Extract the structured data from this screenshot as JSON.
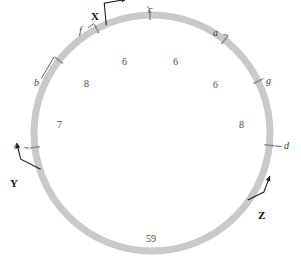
{
  "diagram": {
    "circle": {
      "center_x": 152,
      "center_y": 133,
      "radius": 118,
      "band_width": 7,
      "band_color": "#c9c9c9"
    },
    "genes": [
      {
        "id": "a",
        "label": "a",
        "angle_deg": 52,
        "label_x": 213,
        "label_y": 28,
        "leader": true
      },
      {
        "id": "b",
        "label": "b",
        "angle_deg": 142,
        "label_x": 34,
        "label_y": 78,
        "leader": true
      },
      {
        "id": "c",
        "label": "c",
        "angle_deg": 91,
        "label_x": 148,
        "label_y": 5,
        "leader": true
      },
      {
        "id": "d",
        "label": "d",
        "angle_deg": 354,
        "label_x": 284,
        "label_y": 141,
        "leader": true
      },
      {
        "id": "e",
        "label": "e",
        "angle_deg": 187,
        "label_x": 14,
        "label_y": 141,
        "leader": true
      },
      {
        "id": "f",
        "label": "f",
        "angle_deg": 118,
        "label_x": 79,
        "label_y": 26,
        "leader": true
      },
      {
        "id": "g",
        "label": "g",
        "angle_deg": 26,
        "label_x": 266,
        "label_y": 76,
        "leader": true
      }
    ],
    "origins": [
      {
        "id": "X",
        "label": "X",
        "label_x": 91,
        "label_y": 11,
        "anchor_angle_deg": 113
      },
      {
        "id": "Y",
        "label": "Y",
        "label_x": 10,
        "label_y": 178,
        "anchor_angle_deg": 198
      },
      {
        "id": "Z",
        "label": "Z",
        "label_x": 258,
        "label_y": 210,
        "anchor_angle_deg": 325
      }
    ],
    "distances": [
      {
        "value": "6",
        "x": 122,
        "y": 57,
        "name": "distance-c-f"
      },
      {
        "value": "6",
        "x": 173,
        "y": 57,
        "name": "distance-c-a"
      },
      {
        "value": "6",
        "x": 213,
        "y": 80,
        "name": "distance-a-g"
      },
      {
        "value": "8",
        "x": 84,
        "y": 79,
        "name": "distance-f-b"
      },
      {
        "value": "8",
        "x": 239,
        "y": 120,
        "name": "distance-g-d"
      },
      {
        "value": "7",
        "x": 57,
        "y": 120,
        "name": "distance-b-e"
      },
      {
        "value": "59",
        "x": 146,
        "y": 234,
        "name": "distance-d-e"
      }
    ]
  }
}
